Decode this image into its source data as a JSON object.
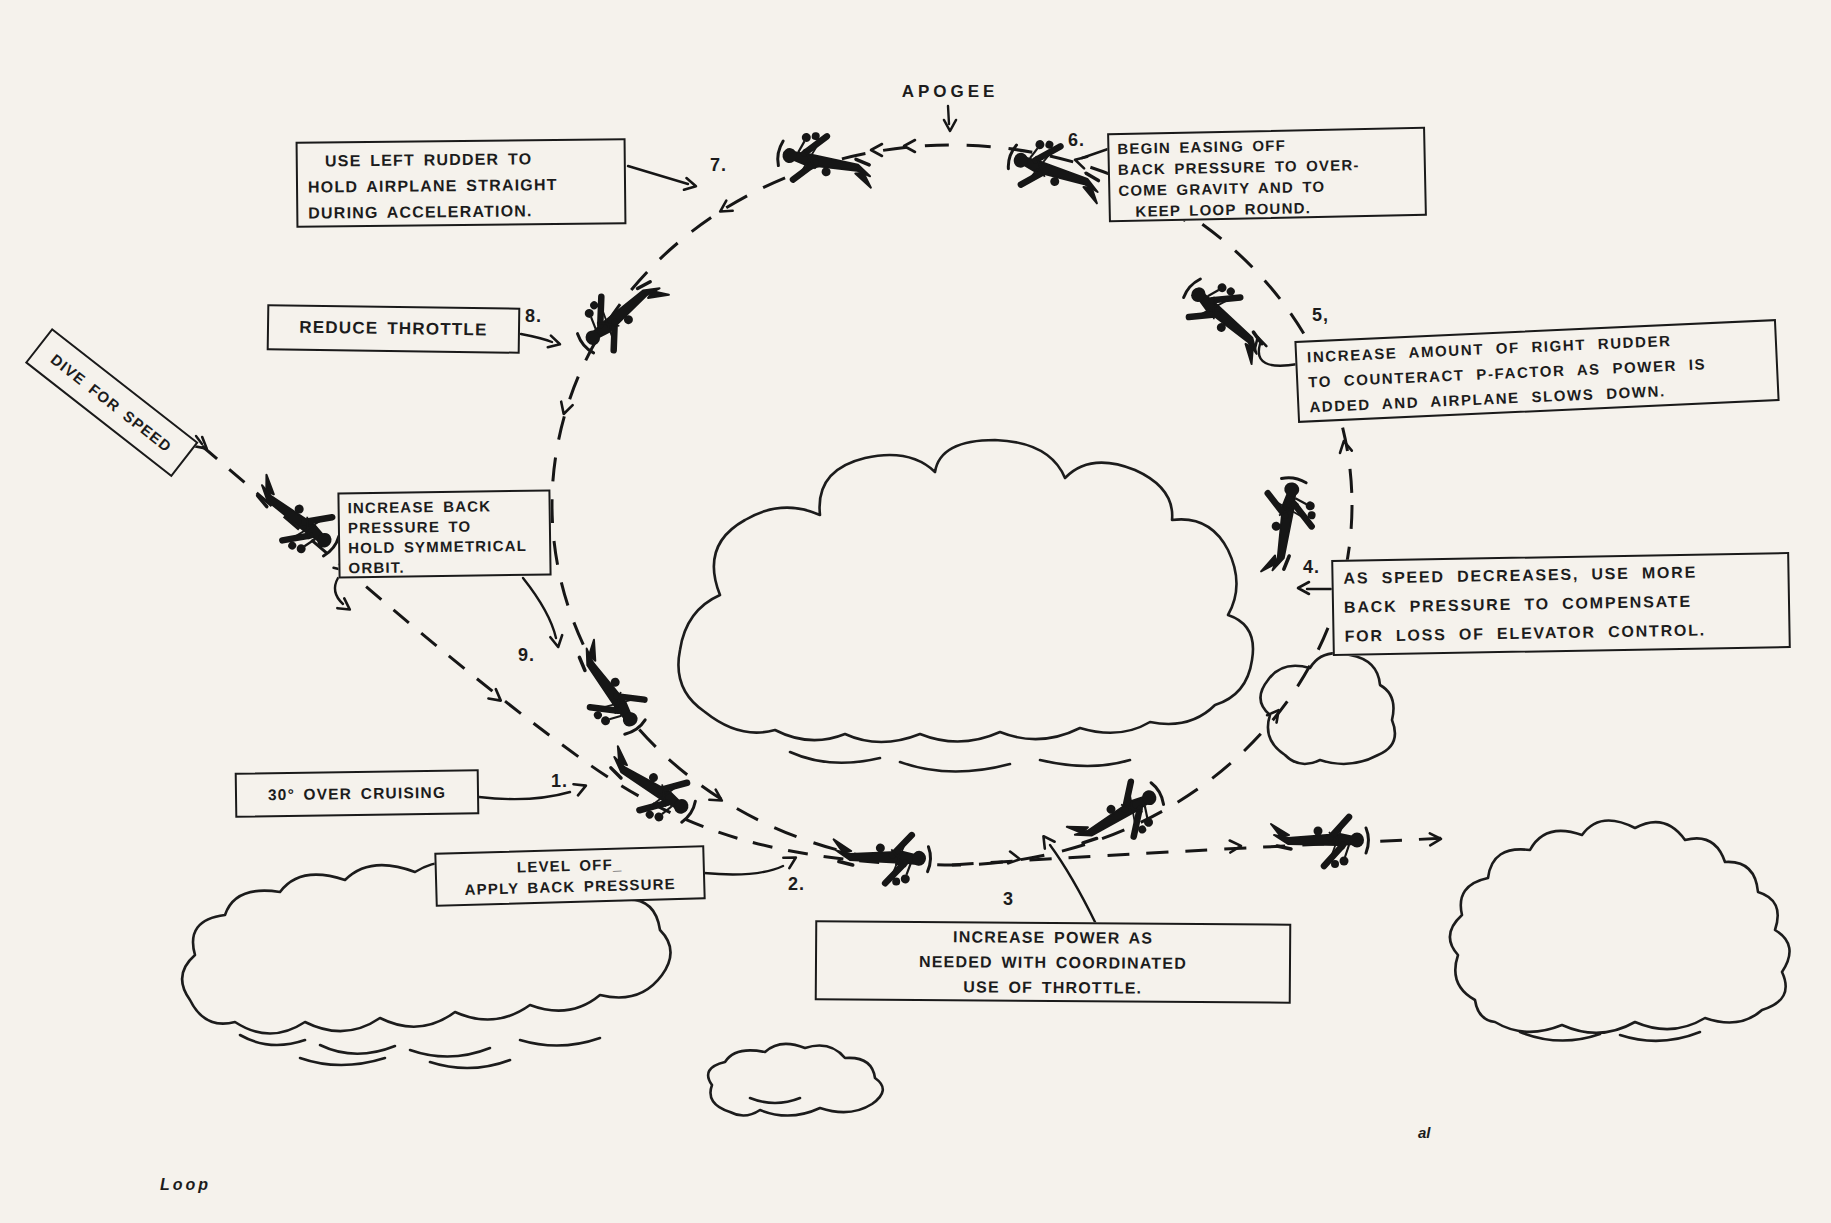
{
  "figure": {
    "caption": "Loop",
    "apogee_label": "APOGEE",
    "signature": "al"
  },
  "annotations": {
    "dive": {
      "text": "DIVE FOR SPEED"
    },
    "step1": {
      "num": "1.",
      "text": "30° OVER CRUISING"
    },
    "step2": {
      "num": "2.",
      "text": "LEVEL OFF_\nAPPLY BACK PRESSURE"
    },
    "step3": {
      "num": "3",
      "text": "INCREASE POWER AS\nNEEDED WITH COORDINATED\nUSE OF THROTTLE."
    },
    "step4": {
      "num": "4.",
      "text": "AS SPEED DECREASES, USE MORE\nBACK PRESSURE TO COMPENSATE\nFOR LOSS OF ELEVATOR CONTROL."
    },
    "step5": {
      "num": "5,",
      "text": "INCREASE AMOUNT OF RIGHT RUDDER\nTO COUNTERACT P-FACTOR AS POWER IS\nADDED AND AIRPLANE SLOWS DOWN."
    },
    "step6": {
      "num": "6.",
      "text": "BEGIN EASING OFF\nBACK PRESSURE TO OVER-\nCOME GRAVITY AND TO\n  KEEP LOOP ROUND."
    },
    "step7": {
      "num": "7.",
      "text": "  USE LEFT RUDDER TO\nHOLD AIRPLANE STRAIGHT\nDURING ACCELERATION."
    },
    "step8": {
      "num": "8.",
      "text": "REDUCE THROTTLE"
    },
    "step9": {
      "num": "9.",
      "text": "INCREASE BACK\nPRESSURE TO\nHOLD SYMMETRICAL\nORBIT."
    }
  }
}
